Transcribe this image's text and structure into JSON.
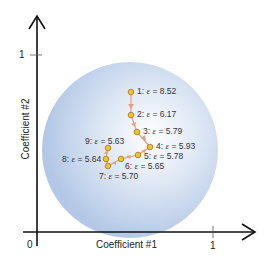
{
  "diagram": {
    "x_axis": {
      "label": "Coefficient #1",
      "origin_label": "0",
      "tick_label": "1"
    },
    "y_axis": {
      "label": "Coefficient #2",
      "tick_label": "1"
    },
    "region_color": "#b9cde9",
    "path_color": "#e8a07a",
    "point_fill": "#f2c230",
    "point_stroke": "#b07a10",
    "points": [
      {
        "id": "1",
        "label": "1:",
        "eps": "ε",
        "value": "= 8.52"
      },
      {
        "id": "2",
        "label": "2:",
        "eps": "ε",
        "value": "= 6.17"
      },
      {
        "id": "3",
        "label": "3:",
        "eps": "ε",
        "value": "= 5.79"
      },
      {
        "id": "4",
        "label": "4:",
        "eps": "ε",
        "value": "= 5.93"
      },
      {
        "id": "5",
        "label": "5:",
        "eps": "ε",
        "value": "= 5.78"
      },
      {
        "id": "6",
        "label": "6:",
        "eps": "ε",
        "value": "= 5.65"
      },
      {
        "id": "7",
        "label": "7:",
        "eps": "ε",
        "value": "= 5.70"
      },
      {
        "id": "8",
        "label": "8:",
        "eps": "ε",
        "value": "= 5.64"
      },
      {
        "id": "9",
        "label": "9:",
        "eps": "ε",
        "value": "= 5.63"
      }
    ]
  }
}
